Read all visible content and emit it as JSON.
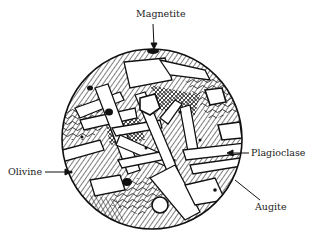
{
  "diagram": {
    "type": "thin-section",
    "labels": [
      {
        "id": "magnetite",
        "text": "Magnetite"
      },
      {
        "id": "olivine",
        "text": "Olivine"
      },
      {
        "id": "plagioclase",
        "text": "Plagioclase"
      },
      {
        "id": "augite",
        "text": "Augite"
      }
    ],
    "colors": {
      "ink": "#111111",
      "background": "#ffffff"
    }
  }
}
